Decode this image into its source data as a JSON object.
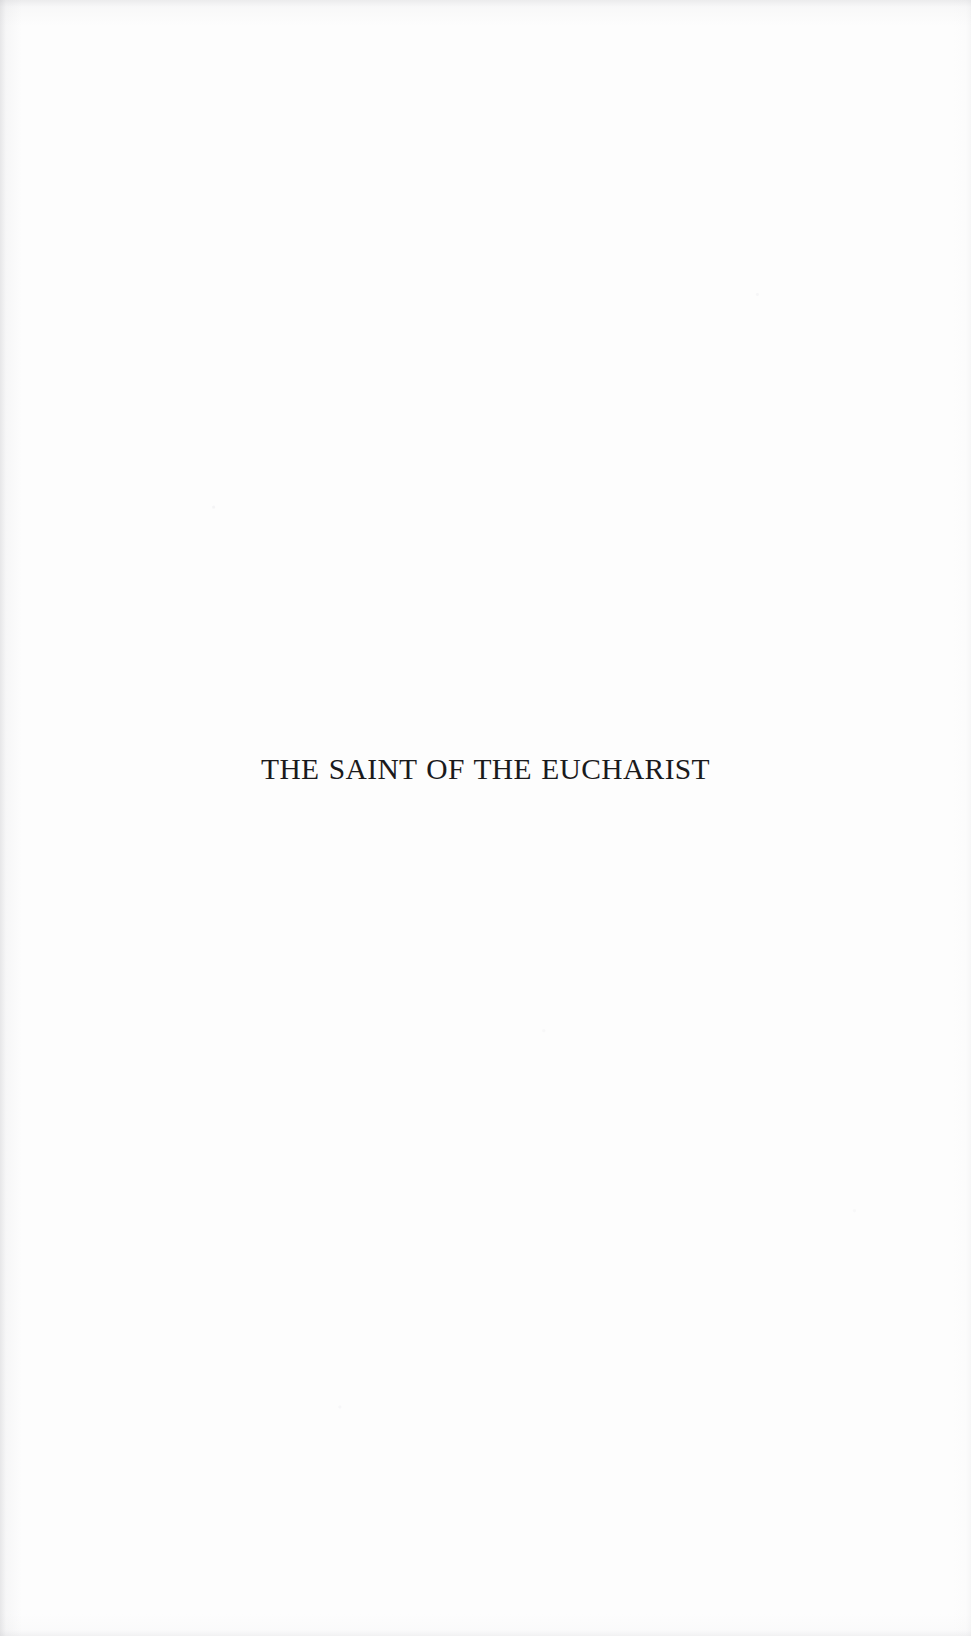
{
  "document": {
    "kind": "half-title-page",
    "page_background_color": "#fdfdfd",
    "ink_color": "#1a1a1c"
  },
  "title_block": {
    "half_title": "THE SAINT OF THE EUCHARIST"
  }
}
